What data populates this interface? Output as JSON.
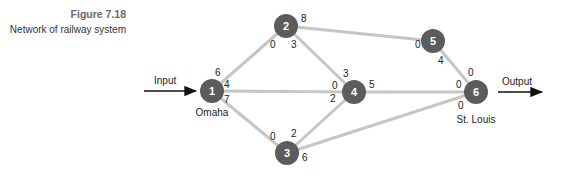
{
  "caption": {
    "figure_number": "Figure 7.18",
    "title": "Network of railway system"
  },
  "io": {
    "input_label": "Input",
    "output_label": "Output"
  },
  "nodes": [
    {
      "id": "1",
      "label": "1",
      "city": "Omaha"
    },
    {
      "id": "2",
      "label": "2",
      "city": ""
    },
    {
      "id": "3",
      "label": "3",
      "city": ""
    },
    {
      "id": "4",
      "label": "4",
      "city": ""
    },
    {
      "id": "5",
      "label": "5",
      "city": ""
    },
    {
      "id": "6",
      "label": "6",
      "city": "St. Louis"
    }
  ],
  "edges": [
    {
      "from": "1",
      "to": "2",
      "cap_from": "6",
      "cap_to": "0"
    },
    {
      "from": "1",
      "to": "4",
      "cap_from": "4",
      "cap_to": "0"
    },
    {
      "from": "1",
      "to": "3",
      "cap_from": "7",
      "cap_to": "0"
    },
    {
      "from": "2",
      "to": "5",
      "cap_from": "8",
      "cap_to": "0"
    },
    {
      "from": "2",
      "to": "4",
      "cap_from": "3",
      "cap_to": "3"
    },
    {
      "from": "3",
      "to": "4",
      "cap_from": "2",
      "cap_to": "2"
    },
    {
      "from": "3",
      "to": "6",
      "cap_from": "6",
      "cap_to": "0"
    },
    {
      "from": "4",
      "to": "6",
      "cap_from": "5",
      "cap_to": "0"
    },
    {
      "from": "5",
      "to": "6",
      "cap_from": "4",
      "cap_to": "0"
    }
  ],
  "colors": {
    "node_fill": "#5c5c5c",
    "edge": "#c6c6c6",
    "text": "#222222"
  }
}
